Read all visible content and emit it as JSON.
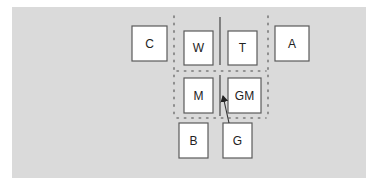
{
  "diagram": {
    "type": "room-layout",
    "boxes": [
      {
        "id": "C",
        "label": "C"
      },
      {
        "id": "W",
        "label": "W"
      },
      {
        "id": "T",
        "label": "T"
      },
      {
        "id": "A",
        "label": "A"
      },
      {
        "id": "M",
        "label": "M"
      },
      {
        "id": "GM",
        "label": "GM"
      },
      {
        "id": "B",
        "label": "B"
      },
      {
        "id": "G",
        "label": "G"
      }
    ],
    "arrows": [
      {
        "from": "G",
        "to": "between M and GM"
      }
    ],
    "colors": {
      "background": "#dadada",
      "box_fill": "#ffffff",
      "box_stroke": "#5a5a5a"
    }
  }
}
